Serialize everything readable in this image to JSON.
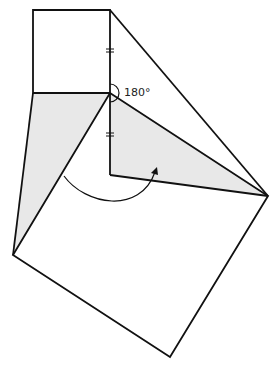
{
  "diagram": {
    "angle_label": "180°",
    "colors": {
      "stroke": "#111111",
      "shade": "#e8e8e8",
      "background": "#ffffff"
    },
    "elements": [
      "top square",
      "left shaded triangle",
      "right shaded triangle",
      "large tilted square",
      "rotation arrow",
      "equal-length tick marks",
      "180 degree angle arc"
    ]
  }
}
